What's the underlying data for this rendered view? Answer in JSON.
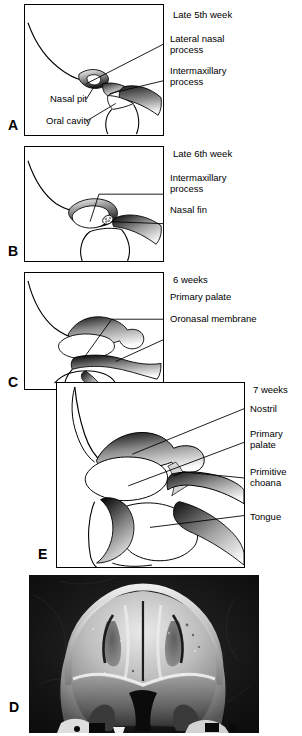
{
  "figure": {
    "title_hidden": "",
    "panels": [
      {
        "id": "A",
        "panel_letter": "A",
        "stage_label": "Late 5th week",
        "labels": [
          {
            "name": "lateral-nasal-process",
            "text": "Lateral nasal\nprocess"
          },
          {
            "name": "intermaxillary-process",
            "text": "Intermaxillary\nprocess"
          },
          {
            "name": "nasal-pit",
            "text": "Nasal pit"
          },
          {
            "name": "oral-cavity",
            "text": "Oral cavity"
          }
        ]
      },
      {
        "id": "B",
        "panel_letter": "B",
        "stage_label": "Late 6th week",
        "labels": [
          {
            "name": "intermaxillary-process",
            "text": "Intermaxillary\nprocess"
          },
          {
            "name": "nasal-fin",
            "text": "Nasal fin"
          }
        ]
      },
      {
        "id": "C",
        "panel_letter": "C",
        "stage_label": "6 weeks",
        "labels": [
          {
            "name": "primary-palate",
            "text": "Primary palate"
          },
          {
            "name": "oronasal-membrane",
            "text": "Oronasal membrane"
          }
        ]
      },
      {
        "id": "E",
        "panel_letter": "E",
        "stage_label": "7 weeks",
        "labels": [
          {
            "name": "nostril",
            "text": "Nostril"
          },
          {
            "name": "primary-palate",
            "text": "Primary\npalate"
          },
          {
            "name": "primitive-choana",
            "text": "Primitive\nchoana"
          },
          {
            "name": "tongue",
            "text": "Tongue"
          }
        ]
      },
      {
        "id": "D",
        "panel_letter": "D",
        "stage_label": "",
        "labels": []
      }
    ]
  },
  "colors": {
    "ink": "#000000",
    "paper": "#ffffff",
    "tissue_dark": "#2b2b2b",
    "tissue_mid": "#6e6e6e",
    "tissue_light": "#d8d8d8",
    "photo_background": "#0d0d0d",
    "photo_highlight": "#f2f2f2"
  }
}
